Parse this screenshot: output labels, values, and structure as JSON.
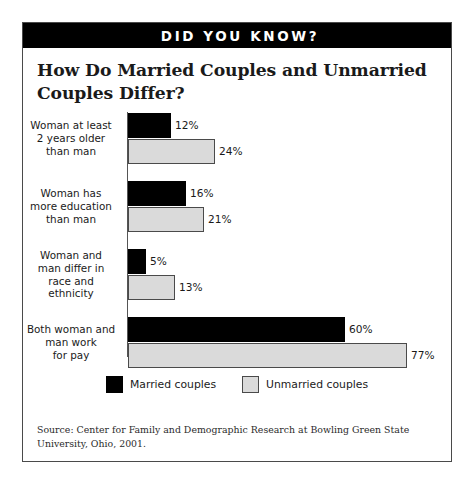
{
  "banner": {
    "text": "DID YOU KNOW?"
  },
  "title": "How Do Married Couples and Unmarried Couples Differ?",
  "source": "Source:  Center for Family and Demographic Research at Bowling Green State University, Ohio, 2001.",
  "colors": {
    "married": "#000000",
    "unmarried": "#dadada",
    "banner_bg": "#000000",
    "banner_text": "#ffffff",
    "frame": "#4a4a4a"
  },
  "chart_data": {
    "type": "bar",
    "orientation": "horizontal",
    "title": "How Do Married Couples and Unmarried Couples Differ?",
    "xlabel": "",
    "ylabel": "",
    "xlim": [
      0,
      80
    ],
    "grid": false,
    "legend_position": "bottom",
    "value_suffix": "%",
    "categories": [
      "Woman at least 2 years older than man",
      "Woman has more education than man",
      "Woman and man differ in race  and ethnicity",
      "Both woman and man work for pay"
    ],
    "category_lines": [
      [
        "Woman at least",
        "2 years older",
        "than man"
      ],
      [
        "Woman has",
        "more education",
        "than man"
      ],
      [
        "Woman and",
        "man differ in",
        "race  and",
        "ethnicity"
      ],
      [
        "Both woman and",
        "man work",
        "for pay"
      ]
    ],
    "series": [
      {
        "name": "Married couples",
        "color": "#000000",
        "values": [
          12,
          16,
          5,
          60
        ],
        "labels": [
          "12%",
          "16%",
          "5%",
          "60%"
        ]
      },
      {
        "name": "Unmarried couples",
        "color": "#dadada",
        "values": [
          24,
          21,
          13,
          77
        ],
        "labels": [
          "24%",
          "21%",
          "13%",
          "77%"
        ]
      }
    ]
  }
}
